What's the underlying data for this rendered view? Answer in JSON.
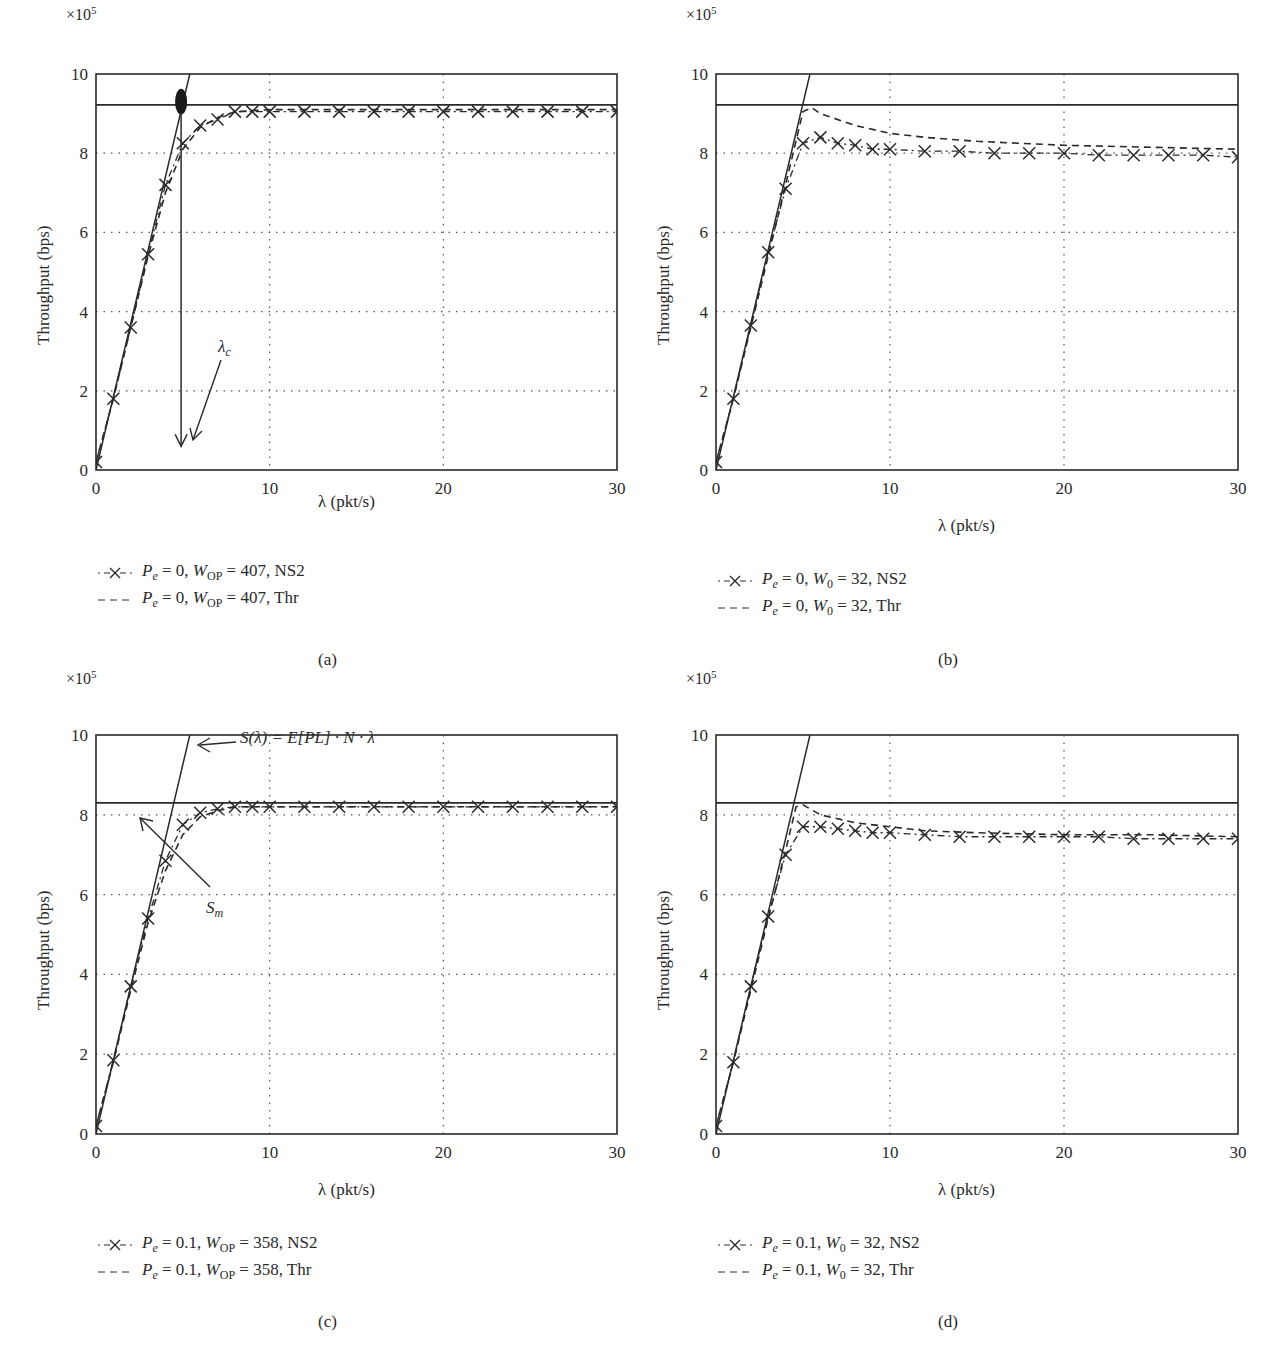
{
  "chart_data": [
    {
      "id": "a",
      "type": "line",
      "caption": "(a)",
      "xlabel": "λ (pkt/s)",
      "ylabel": "Throughput (bps)",
      "y_multiplier": "×10^5",
      "xlim": [
        0,
        30
      ],
      "ylim": [
        0,
        10
      ],
      "xticks": [
        0,
        10,
        20,
        30
      ],
      "yticks": [
        0,
        2,
        4,
        6,
        8,
        10
      ],
      "grid": "dotted",
      "reference_lines": {
        "linear_S_lambda": {
          "x": [
            0,
            5.4
          ],
          "y": [
            0,
            10
          ]
        },
        "saturation_hline": 9.22
      },
      "series": [
        {
          "name": "Pe = 0, WOP = 407, NS2",
          "style": "dash-dot with x markers",
          "x": [
            0,
            1,
            2,
            3,
            4,
            5,
            6,
            7,
            8,
            9,
            10,
            12,
            14,
            16,
            18,
            20,
            22,
            24,
            26,
            28,
            30
          ],
          "y": [
            0.2,
            1.8,
            3.6,
            5.45,
            7.2,
            8.25,
            8.7,
            8.85,
            9.05,
            9.05,
            9.05,
            9.05,
            9.05,
            9.05,
            9.05,
            9.05,
            9.05,
            9.05,
            9.05,
            9.05,
            9.05
          ]
        },
        {
          "name": "Pe = 0, WOP = 407, Thr",
          "style": "dashed",
          "x": [
            0,
            1,
            2,
            3,
            4,
            5,
            6,
            7,
            8,
            10,
            15,
            20,
            25,
            30
          ],
          "y": [
            0.2,
            1.8,
            3.6,
            5.4,
            7.0,
            8.1,
            8.65,
            8.9,
            9.05,
            9.1,
            9.1,
            9.1,
            9.1,
            9.1
          ]
        }
      ],
      "annotations": [
        {
          "text": "λc",
          "type": "arrow",
          "target_x": 4.9,
          "target_y": 0.7
        },
        {
          "type": "filled-ellipse",
          "x": 4.9,
          "y": 9.2
        },
        {
          "type": "vertical-arrow",
          "x": 4.9,
          "from_y": 9.2,
          "to_y": 0.6
        }
      ]
    },
    {
      "id": "b",
      "type": "line",
      "caption": "(b)",
      "xlabel": "λ (pkt/s)",
      "ylabel": "Throughput (bps)",
      "y_multiplier": "×10^5",
      "xlim": [
        0,
        30
      ],
      "ylim": [
        0,
        10
      ],
      "xticks": [
        0,
        10,
        20,
        30
      ],
      "yticks": [
        0,
        2,
        4,
        6,
        8,
        10
      ],
      "grid": "dotted",
      "reference_lines": {
        "linear_S_lambda": {
          "x": [
            0,
            5.4
          ],
          "y": [
            0,
            10
          ]
        },
        "saturation_hline": 9.22
      },
      "series": [
        {
          "name": "Pe = 0, W0 = 32, NS2",
          "style": "dash-dot with x markers",
          "x": [
            0,
            1,
            2,
            3,
            4,
            5,
            6,
            7,
            8,
            9,
            10,
            12,
            14,
            16,
            18,
            20,
            22,
            24,
            26,
            28,
            30
          ],
          "y": [
            0.2,
            1.8,
            3.65,
            5.5,
            7.1,
            8.25,
            8.4,
            8.25,
            8.2,
            8.1,
            8.1,
            8.05,
            8.05,
            8.0,
            8.0,
            8.0,
            7.95,
            7.95,
            7.95,
            7.95,
            7.9
          ]
        },
        {
          "name": "Pe = 0, W0 = 32, Thr",
          "style": "dashed",
          "x": [
            0,
            1,
            2,
            3,
            4,
            5,
            5.5,
            6,
            8,
            10,
            12,
            15,
            20,
            25,
            30
          ],
          "y": [
            0.2,
            1.8,
            3.6,
            5.4,
            7.2,
            9.05,
            9.15,
            9.0,
            8.7,
            8.5,
            8.4,
            8.3,
            8.2,
            8.15,
            8.1
          ]
        }
      ]
    },
    {
      "id": "c",
      "type": "line",
      "caption": "(c)",
      "xlabel": "λ (pkt/s)",
      "ylabel": "Throughput (bps)",
      "y_multiplier": "×10^5",
      "xlim": [
        0,
        30
      ],
      "ylim": [
        0,
        10
      ],
      "xticks": [
        0,
        10,
        20,
        30
      ],
      "yticks": [
        0,
        2,
        4,
        6,
        8,
        10
      ],
      "grid": "dotted",
      "reference_lines": {
        "linear_S_lambda": {
          "x": [
            0,
            5.4
          ],
          "y": [
            0,
            10
          ]
        },
        "saturation_hline": 8.3
      },
      "series": [
        {
          "name": "Pe = 0.1, WOP = 358, NS2",
          "style": "dash-dot with x markers",
          "x": [
            0,
            1,
            2,
            3,
            4,
            5,
            6,
            7,
            8,
            9,
            10,
            12,
            14,
            16,
            18,
            20,
            22,
            24,
            26,
            28,
            30
          ],
          "y": [
            0.2,
            1.85,
            3.7,
            5.4,
            6.85,
            7.75,
            8.05,
            8.15,
            8.2,
            8.2,
            8.2,
            8.2,
            8.2,
            8.2,
            8.2,
            8.2,
            8.2,
            8.2,
            8.2,
            8.2,
            8.2
          ]
        },
        {
          "name": "Pe = 0.1, WOP = 358, Thr",
          "style": "dashed",
          "x": [
            0,
            1,
            2,
            3,
            4,
            5,
            6,
            7,
            8,
            10,
            15,
            20,
            25,
            30
          ],
          "y": [
            0.2,
            1.8,
            3.6,
            5.3,
            6.6,
            7.5,
            7.95,
            8.1,
            8.2,
            8.2,
            8.2,
            8.2,
            8.2,
            8.2
          ]
        }
      ],
      "annotations": [
        {
          "text": "S(λ) = E[PL] · N · λ",
          "type": "arrow",
          "target_x": 5.8,
          "target_y": 9.0
        },
        {
          "text": "Sm",
          "type": "arrow",
          "target_x": 2.6,
          "target_y": 8.0
        }
      ]
    },
    {
      "id": "d",
      "type": "line",
      "caption": "(d)",
      "xlabel": "λ (pkt/s)",
      "ylabel": "Throughput (bps)",
      "y_multiplier": "×10^5",
      "xlim": [
        0,
        30
      ],
      "ylim": [
        0,
        10
      ],
      "xticks": [
        0,
        10,
        20,
        30
      ],
      "yticks": [
        0,
        2,
        4,
        6,
        8,
        10
      ],
      "grid": "dotted",
      "reference_lines": {
        "linear_S_lambda": {
          "x": [
            0,
            5.4
          ],
          "y": [
            0,
            10
          ]
        },
        "saturation_hline": 8.3
      },
      "series": [
        {
          "name": "Pe = 0.1, W0 = 32, NS2",
          "style": "dash-dot with x markers",
          "x": [
            0,
            1,
            2,
            3,
            4,
            5,
            6,
            7,
            8,
            9,
            10,
            12,
            14,
            16,
            18,
            20,
            22,
            24,
            26,
            28,
            30
          ],
          "y": [
            0.2,
            1.8,
            3.7,
            5.45,
            7.0,
            7.7,
            7.7,
            7.65,
            7.6,
            7.55,
            7.55,
            7.5,
            7.45,
            7.45,
            7.45,
            7.45,
            7.45,
            7.4,
            7.4,
            7.4,
            7.4
          ]
        },
        {
          "name": "Pe = 0.1, W0 = 32, Thr",
          "style": "dashed",
          "x": [
            0,
            1,
            2,
            3,
            4,
            4.6,
            5,
            6,
            8,
            10,
            12,
            15,
            20,
            25,
            30
          ],
          "y": [
            0.2,
            1.8,
            3.6,
            5.4,
            7.1,
            8.2,
            8.25,
            8.0,
            7.8,
            7.7,
            7.6,
            7.55,
            7.5,
            7.5,
            7.45
          ]
        }
      ]
    }
  ],
  "panels": {
    "a": {
      "caption": "(a)",
      "exp": "×10",
      "exp_power": "5",
      "xlabel": "λ (pkt/s)",
      "ylabel": "Throughput (bps)",
      "legend": [
        {
          "pe": "P",
          "pe_sub": "e",
          "eq": " = 0, ",
          "w": "W",
          "w_sub": "OP",
          "rest": " = 407, NS2"
        },
        {
          "pe": "P",
          "pe_sub": "e",
          "eq": " = 0, ",
          "w": "W",
          "w_sub": "OP",
          "rest": " = 407, Thr"
        }
      ],
      "annotation_lambda_c": "λ",
      "annotation_lambda_c_sub": "c"
    },
    "b": {
      "caption": "(b)",
      "exp": "×10",
      "exp_power": "5",
      "xlabel": "λ (pkt/s)",
      "ylabel": "Throughput (bps)",
      "legend": [
        {
          "pe": "P",
          "pe_sub": "e",
          "eq": " = 0, ",
          "w": "W",
          "w_sub": "0",
          "rest": " = 32, NS2"
        },
        {
          "pe": "P",
          "pe_sub": "e",
          "eq": " = 0, ",
          "w": "W",
          "w_sub": "0",
          "rest": " = 32, Thr"
        }
      ]
    },
    "c": {
      "caption": "(c)",
      "exp": "×10",
      "exp_power": "5",
      "xlabel": "λ (pkt/s)",
      "ylabel": "Throughput (bps)",
      "legend": [
        {
          "pe": "P",
          "pe_sub": "e",
          "eq": " = 0.1, ",
          "w": "W",
          "w_sub": "OP",
          "rest": " = 358, NS2"
        },
        {
          "pe": "P",
          "pe_sub": "e",
          "eq": " = 0.1, ",
          "w": "W",
          "w_sub": "OP",
          "rest": " = 358, Thr"
        }
      ],
      "annotation_formula": "S(λ) = E[PL] · N · λ",
      "annotation_sm": "S",
      "annotation_sm_sub": "m"
    },
    "d": {
      "caption": "(d)",
      "exp": "×10",
      "exp_power": "5",
      "xlabel": "λ (pkt/s)",
      "ylabel": "Throughput (bps)",
      "legend": [
        {
          "pe": "P",
          "pe_sub": "e",
          "eq": " = 0.1, ",
          "w": "W",
          "w_sub": "0",
          "rest": " = 32, NS2"
        },
        {
          "pe": "P",
          "pe_sub": "e",
          "eq": " = 0.1, ",
          "w": "W",
          "w_sub": "0",
          "rest": " = 32, Thr"
        }
      ]
    }
  },
  "tick_labels": {
    "x": [
      "0",
      "10",
      "20",
      "30"
    ],
    "y": [
      "0",
      "2",
      "4",
      "6",
      "8",
      "10"
    ]
  },
  "colors": {
    "ink": "#2a2a2a",
    "grid": "#555555",
    "background": "#ffffff"
  }
}
